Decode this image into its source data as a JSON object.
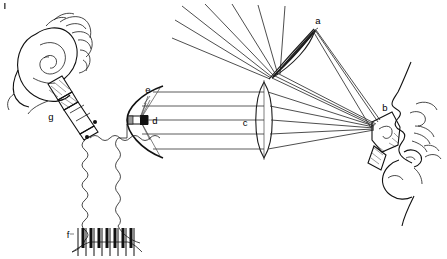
{
  "figure": {
    "background_color": "#ffffff",
    "ink_color": "#111111",
    "ray_color": "#3a3a3a",
    "width": 447,
    "height": 259
  },
  "labels": [
    {
      "id": "a",
      "text": "a",
      "x": 318,
      "y": 24,
      "refers_to": "tilted-condenser-lens"
    },
    {
      "id": "b",
      "text": "b",
      "x": 385,
      "y": 111,
      "refers_to": "mouth-sensor-microphone"
    },
    {
      "id": "c",
      "text": "c",
      "x": 245,
      "y": 126,
      "refers_to": "biconvex-lens"
    },
    {
      "id": "d",
      "text": "d",
      "x": 153,
      "y": 122,
      "refers_to": "light-source-element"
    },
    {
      "id": "e",
      "text": "e",
      "x": 148,
      "y": 92,
      "refers_to": "parabolic-reflector"
    },
    {
      "id": "f",
      "text": "f",
      "x": 67,
      "y": 236,
      "refers_to": "keyboard"
    },
    {
      "id": "g",
      "text": "g",
      "x": 51,
      "y": 118,
      "refers_to": "earphone-receiver"
    }
  ],
  "components": {
    "tilted_lens": {
      "name": "a",
      "description": "tilted biconvex condenser lens"
    },
    "mouth_sensor": {
      "name": "b",
      "description": "sensor held at the speaker's mouth"
    },
    "biconvex_lens": {
      "name": "c",
      "description": "biconvex collimating lens"
    },
    "source_element": {
      "name": "d",
      "description": "light source at reflector focus"
    },
    "parabolic_reflector": {
      "name": "e",
      "description": "parabolic mirror"
    },
    "keyboard": {
      "name": "f",
      "description": "piano-style key console",
      "white_keys": 8,
      "black_keys": 7
    },
    "earphone": {
      "name": "g",
      "description": "earphone receiver in listener's ear"
    }
  },
  "ray_bundles": {
    "upper_diagonal_rays": 5,
    "horizontal_rays_reflector_to_lens": 5,
    "converging_rays_to_mouth": 5,
    "reflector_fan_rays": 4
  }
}
